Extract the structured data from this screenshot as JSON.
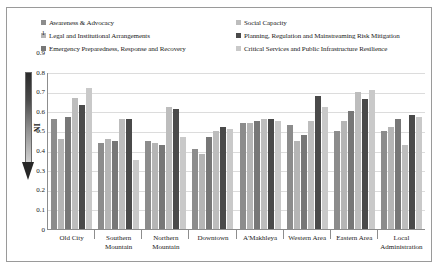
{
  "chart_data": {
    "type": "bar",
    "title": "",
    "xlabel": "",
    "ylabel": "NI",
    "ylim": [
      0,
      1
    ],
    "yticks": [
      "1",
      "0.9",
      "0.8",
      "0.7",
      "0.6",
      "0.5",
      "0.4",
      "0.3",
      "0.2",
      "0.1",
      "0"
    ],
    "grid": true,
    "legend_position": "top",
    "categories": [
      "Old City",
      "Southern Mountain",
      "Northern Mountain",
      "Downtown",
      "A'Makhleya",
      "Western Area",
      "Eastern Area",
      "Local Administration"
    ],
    "series": [
      {
        "name": "Awareness & Advocacy",
        "color": "#8c8c8c",
        "values": [
          0.56,
          0.44,
          0.45,
          0.41,
          0.54,
          0.53,
          0.5,
          0.5
        ]
      },
      {
        "name": "Legal and Institutional Arrangements",
        "color": "#b5b5b5",
        "values": [
          0.46,
          0.46,
          0.44,
          0.38,
          0.54,
          0.45,
          0.55,
          0.52
        ]
      },
      {
        "name": "Emergency Preparedness, Response and Recovery",
        "color": "#777777",
        "values": [
          0.57,
          0.45,
          0.43,
          0.47,
          0.55,
          0.48,
          0.6,
          0.56
        ]
      },
      {
        "name": "Social Capacity",
        "color": "#bdbdbd",
        "values": [
          0.67,
          0.56,
          0.62,
          0.5,
          0.56,
          0.55,
          0.7,
          0.43
        ]
      },
      {
        "name": "Planning, Regulation and Mainstreaming Risk Mitigation",
        "color": "#4a4a4a",
        "values": [
          0.63,
          0.56,
          0.61,
          0.52,
          0.56,
          0.68,
          0.66,
          0.58
        ]
      },
      {
        "name": "Critical Services and Public Infrastructure Resilience",
        "color": "#c9c9c9",
        "values": [
          0.72,
          0.35,
          0.47,
          0.51,
          0.55,
          0.62,
          0.71,
          0.57
        ]
      }
    ]
  },
  "axis": {
    "y_title": "NI",
    "arrow_name": "ni-gradient-arrow"
  }
}
